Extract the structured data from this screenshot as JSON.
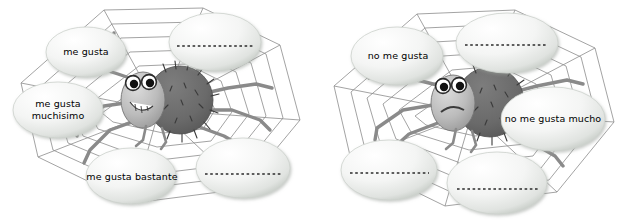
{
  "worksheet": {
    "title": "Spider web opinion scale worksheet",
    "background_color": "#ffffff",
    "text_color": "#000000",
    "web_line_color": "#8c8c8c",
    "bubble_fill_light": "#ffffff",
    "bubble_fill_edge": "#c9cdc9",
    "spider_body_dark": "#6b6b6b",
    "spider_head_light": "#bdbdbd",
    "spider_leg_color": "#8a8a8a"
  },
  "panels": [
    {
      "id": "left-web",
      "name": "positive-opinion-web",
      "spider_expression": "smiling",
      "bubbles": [
        {
          "id": "l1",
          "label": "me gusta",
          "filled": true,
          "blank_line": false
        },
        {
          "id": "l2",
          "label": "me gusta\nmuchisimo",
          "filled": true,
          "blank_line": false
        },
        {
          "id": "l3",
          "label": "me gusta bastante",
          "filled": true,
          "blank_line": false
        },
        {
          "id": "l4",
          "label": "",
          "filled": false,
          "blank_line": true
        },
        {
          "id": "l5",
          "label": "",
          "filled": false,
          "blank_line": true
        }
      ]
    },
    {
      "id": "right-web",
      "name": "negative-opinion-web",
      "spider_expression": "frowning",
      "bubbles": [
        {
          "id": "r1",
          "label": "no me gusta",
          "filled": true,
          "blank_line": false
        },
        {
          "id": "r2",
          "label": "no me gusta mucho",
          "filled": true,
          "blank_line": false
        },
        {
          "id": "r3",
          "label": "",
          "filled": false,
          "blank_line": true
        },
        {
          "id": "r4",
          "label": "",
          "filled": false,
          "blank_line": true
        },
        {
          "id": "r5",
          "label": "",
          "filled": false,
          "blank_line": true
        }
      ]
    }
  ],
  "labels": {
    "left": {
      "b1": "me gusta",
      "b2": "me gusta\nmuchisimo",
      "b3": "me gusta bastante"
    },
    "right": {
      "b1": "no me gusta",
      "b2": "no me gusta mucho"
    }
  }
}
